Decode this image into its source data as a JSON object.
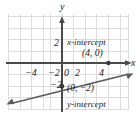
{
  "colors": {
    "background": "#ffffff",
    "grid": "#dcdcdc",
    "axis": "#4a4a4a",
    "line": "#5a5a5a",
    "text": "#1a1a1a"
  },
  "axes": {
    "x_label": "x",
    "y_label": "y",
    "x_ticks": [
      {
        "label": "−4",
        "value": -4
      },
      {
        "label": "−2",
        "value": -2
      },
      {
        "label": "0",
        "value": 0
      },
      {
        "label": "2",
        "value": 2
      },
      {
        "label": "4",
        "value": 4
      }
    ],
    "y_ticks": [
      {
        "label": "2",
        "value": 2
      },
      {
        "label": "−2",
        "value": -2
      }
    ],
    "xlim": [
      -5,
      6
    ],
    "ylim": [
      -4,
      4
    ],
    "grid": true
  },
  "plot": {
    "type": "line",
    "slope": 0.5,
    "intercept": -2,
    "equation": "y = 0.5x − 2"
  },
  "annotations": {
    "x_intercept": {
      "name_label": "x-intercept",
      "point_label": "(4, 0)",
      "x": 4,
      "y": 0
    },
    "y_intercept": {
      "name_label": "y-intercept",
      "point_label": "(0, −2)",
      "x": 0,
      "y": -2
    }
  }
}
